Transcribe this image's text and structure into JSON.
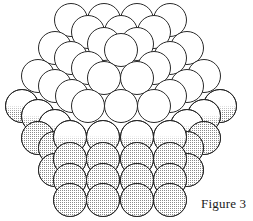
{
  "figure": {
    "caption": "Figure 3",
    "colors": {
      "background": "#ffffff",
      "stroke": "#2a2a2a",
      "gap_fill": "#000000",
      "stipple": "#8a8a8a",
      "sphere_fill": "#ffffff"
    },
    "radius": 16.5,
    "spheres": [
      {
        "x": 71,
        "y": 20,
        "s": 0
      },
      {
        "x": 104,
        "y": 20,
        "s": 0
      },
      {
        "x": 137,
        "y": 20,
        "s": 0
      },
      {
        "x": 170,
        "y": 20,
        "s": 0
      },
      {
        "x": 88,
        "y": 32,
        "s": 0
      },
      {
        "x": 121,
        "y": 32,
        "s": 0
      },
      {
        "x": 154,
        "y": 32,
        "s": 0
      },
      {
        "x": 55,
        "y": 48,
        "s": 0
      },
      {
        "x": 187,
        "y": 48,
        "s": 0
      },
      {
        "x": 104,
        "y": 44,
        "s": 0
      },
      {
        "x": 137,
        "y": 44,
        "s": 0
      },
      {
        "x": 71,
        "y": 58,
        "s": 0
      },
      {
        "x": 170,
        "y": 58,
        "s": 0
      },
      {
        "x": 121,
        "y": 50,
        "s": 0
      },
      {
        "x": 38,
        "y": 76,
        "s": 0
      },
      {
        "x": 204,
        "y": 76,
        "s": 0
      },
      {
        "x": 88,
        "y": 68,
        "s": 0
      },
      {
        "x": 154,
        "y": 68,
        "s": 0
      },
      {
        "x": 55,
        "y": 86,
        "s": 0
      },
      {
        "x": 187,
        "y": 86,
        "s": 0
      },
      {
        "x": 104,
        "y": 78,
        "s": 0
      },
      {
        "x": 137,
        "y": 78,
        "s": 0
      },
      {
        "x": 72,
        "y": 96,
        "s": 0
      },
      {
        "x": 170,
        "y": 96,
        "s": 0
      },
      {
        "x": 22,
        "y": 106,
        "s": 1
      },
      {
        "x": 220,
        "y": 106,
        "s": 1
      },
      {
        "x": 88,
        "y": 106,
        "s": 0
      },
      {
        "x": 121,
        "y": 106,
        "s": 0
      },
      {
        "x": 154,
        "y": 106,
        "s": 0
      },
      {
        "x": 38,
        "y": 116,
        "s": 1
      },
      {
        "x": 204,
        "y": 116,
        "s": 1
      },
      {
        "x": 55,
        "y": 126,
        "s": 1
      },
      {
        "x": 187,
        "y": 126,
        "s": 1
      },
      {
        "x": 38,
        "y": 138,
        "s": 2
      },
      {
        "x": 204,
        "y": 138,
        "s": 2
      },
      {
        "x": 55,
        "y": 148,
        "s": 2
      },
      {
        "x": 187,
        "y": 148,
        "s": 2
      },
      {
        "x": 55,
        "y": 170,
        "s": 2
      },
      {
        "x": 187,
        "y": 170,
        "s": 2
      },
      {
        "x": 70,
        "y": 137,
        "s": 1
      },
      {
        "x": 103,
        "y": 137,
        "s": 1
      },
      {
        "x": 137,
        "y": 137,
        "s": 1
      },
      {
        "x": 170,
        "y": 137,
        "s": 1
      },
      {
        "x": 70,
        "y": 159,
        "s": 2
      },
      {
        "x": 103,
        "y": 159,
        "s": 2
      },
      {
        "x": 137,
        "y": 159,
        "s": 2
      },
      {
        "x": 170,
        "y": 159,
        "s": 2
      },
      {
        "x": 70,
        "y": 180,
        "s": 2
      },
      {
        "x": 103,
        "y": 180,
        "s": 2
      },
      {
        "x": 137,
        "y": 180,
        "s": 2
      },
      {
        "x": 170,
        "y": 180,
        "s": 2
      },
      {
        "x": 70,
        "y": 200,
        "s": 2
      },
      {
        "x": 103,
        "y": 200,
        "s": 2
      },
      {
        "x": 137,
        "y": 200,
        "s": 2
      },
      {
        "x": 170,
        "y": 200,
        "s": 2
      }
    ]
  }
}
